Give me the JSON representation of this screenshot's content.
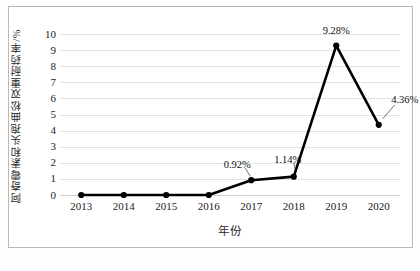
{
  "chart_data": {
    "type": "line",
    "title": "",
    "xlabel": "年份",
    "ylabel": "阿奇霉素和头孢曲松双重耐药率/%",
    "categories": [
      "2013",
      "2014",
      "2015",
      "2016",
      "2017",
      "2018",
      "2019",
      "2020"
    ],
    "values": [
      0,
      0,
      0,
      0,
      0.92,
      1.14,
      9.28,
      4.36
    ],
    "point_labels": [
      "",
      "",
      "",
      "",
      "0.92%",
      "1.14%",
      "9.28%",
      "4.36%"
    ],
    "ylim": [
      0,
      10
    ],
    "ytick_labels": [
      "10",
      "9",
      "8",
      "7",
      "6",
      "5",
      "4",
      "3",
      "2",
      "1",
      "0"
    ],
    "ytick_values": [
      10,
      9,
      8,
      7,
      6,
      5,
      4,
      3,
      2,
      1,
      0
    ],
    "grid": "horizontal",
    "legend": "none",
    "series_color": "#000000",
    "gridline_color": "#e2e2e2",
    "marker": "circle",
    "annotations": [
      {
        "text": "0.92%",
        "leader": true
      },
      {
        "text": "1.14%",
        "leader": true
      },
      {
        "text": "9.28%",
        "leader": false
      },
      {
        "text": "4.36%",
        "leader": true
      }
    ]
  }
}
